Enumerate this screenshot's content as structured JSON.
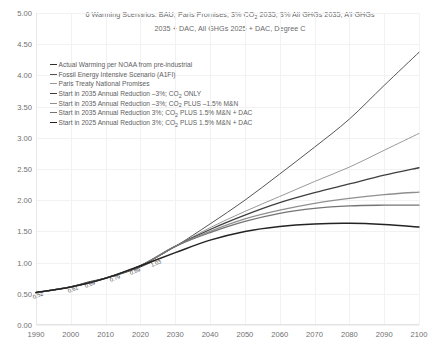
{
  "chart_data": {
    "type": "line",
    "title_line1": "6 Warming Scenarios: BAU, Paris Promises, 3% CO2 2035, 3% All GHGs 2035, All GHGs",
    "title_line2": "2035 + DAC, All GHGs 2025 + DAC, Degree C",
    "xlabel": "",
    "ylabel": "",
    "xlim": [
      1990,
      2100
    ],
    "ylim": [
      0.0,
      5.0
    ],
    "grid": true,
    "legend_position": "upper-left-inside",
    "x_ticks": [
      "1990",
      "2000",
      "2010",
      "2020",
      "2030",
      "2040",
      "2050",
      "2060",
      "2070",
      "2080",
      "2090",
      "2100"
    ],
    "y_ticks": [
      "0.00",
      "0.50",
      "1.00",
      "1.50",
      "2.00",
      "2.50",
      "3.00",
      "3.50",
      "4.00",
      "4.50",
      "5.00"
    ],
    "point_labels": [
      {
        "x": 1990,
        "y": 0.52,
        "text": "0.52"
      },
      {
        "x": 2000,
        "y": 0.61,
        "text": "0.61"
      },
      {
        "x": 2005,
        "y": 0.69,
        "text": "0.69"
      },
      {
        "x": 2012,
        "y": 0.79,
        "text": "0.79"
      },
      {
        "x": 2018,
        "y": 0.89,
        "text": "0.89"
      },
      {
        "x": 2024,
        "y": 1.03,
        "text": "1.03"
      }
    ],
    "series": [
      {
        "name": "Actual Warming per NOAA from pre-industrial",
        "color": "#2e2e2e",
        "width": 1.0,
        "x": [
          1990,
          1995,
          2000,
          2005,
          2010,
          2015,
          2020,
          2024
        ],
        "values": [
          0.52,
          0.56,
          0.61,
          0.69,
          0.75,
          0.83,
          0.93,
          1.03
        ]
      },
      {
        "name": "Fossil Energy Intensive Scenario (A1FI)",
        "color": "#555555",
        "width": 1.0,
        "x": [
          1990,
          2000,
          2010,
          2020,
          2030,
          2040,
          2050,
          2060,
          2070,
          2080,
          2090,
          2100
        ],
        "values": [
          0.52,
          0.61,
          0.75,
          0.95,
          1.26,
          1.62,
          2.0,
          2.42,
          2.85,
          3.3,
          3.84,
          4.37
        ]
      },
      {
        "name": "Paris Treaty National Promises",
        "color": "#9a9a9a",
        "width": 1.0,
        "x": [
          1990,
          2000,
          2010,
          2020,
          2030,
          2040,
          2050,
          2060,
          2070,
          2080,
          2090,
          2100
        ],
        "values": [
          0.52,
          0.61,
          0.75,
          0.95,
          1.26,
          1.56,
          1.82,
          2.06,
          2.3,
          2.53,
          2.8,
          3.07
        ]
      },
      {
        "name": "Start in 2035 Annual Reduction -3%; CO2 ONLY",
        "color": "#3f3f3f",
        "width": 1.3,
        "x": [
          1990,
          2000,
          2010,
          2020,
          2030,
          2040,
          2050,
          2060,
          2070,
          2080,
          2090,
          2100
        ],
        "values": [
          0.52,
          0.61,
          0.75,
          0.95,
          1.26,
          1.53,
          1.76,
          1.96,
          2.12,
          2.26,
          2.4,
          2.52
        ]
      },
      {
        "name": "Start in 2035 Annual Reduction -3%; CO2 PLUS -1.5% M&N",
        "color": "#8f8f8f",
        "width": 1.3,
        "x": [
          1990,
          2000,
          2010,
          2020,
          2030,
          2040,
          2050,
          2060,
          2070,
          2080,
          2090,
          2100
        ],
        "values": [
          0.52,
          0.61,
          0.75,
          0.95,
          1.26,
          1.5,
          1.7,
          1.84,
          1.95,
          2.03,
          2.09,
          2.13
        ]
      },
      {
        "name": "Start in 2035 Annual Reduction 3%; CO2 PLUS 1.5% M&N + DAC",
        "color": "#747474",
        "width": 1.3,
        "x": [
          1990,
          2000,
          2010,
          2020,
          2030,
          2040,
          2050,
          2060,
          2070,
          2080,
          2090,
          2100
        ],
        "values": [
          0.52,
          0.61,
          0.75,
          0.95,
          1.26,
          1.48,
          1.66,
          1.79,
          1.87,
          1.91,
          1.92,
          1.92
        ]
      },
      {
        "name": "Start in 2025 Annual Reduction 3%; CO2 PLUS 1.5% M&N + DAC",
        "color": "#232323",
        "width": 1.5,
        "x": [
          1990,
          2000,
          2010,
          2020,
          2030,
          2040,
          2050,
          2060,
          2070,
          2080,
          2090,
          2100
        ],
        "values": [
          0.52,
          0.61,
          0.75,
          0.95,
          1.16,
          1.36,
          1.5,
          1.58,
          1.62,
          1.63,
          1.61,
          1.57
        ]
      }
    ]
  },
  "legend": {
    "items": [
      {
        "label_pre": "Actual Warming per NOAA from pre-industrial",
        "label_post": "",
        "sub": "",
        "color": "#2e2e2e",
        "width": "1px"
      },
      {
        "label_pre": "Fossil Energy Intensive Scenario (A1FI)",
        "label_post": "",
        "sub": "",
        "color": "#555555",
        "width": "1px"
      },
      {
        "label_pre": "Paris Treaty National Promises",
        "label_post": "",
        "sub": "",
        "color": "#9a9a9a",
        "width": "1px"
      },
      {
        "label_pre": "Start in 2035 Annual Reduction –3%; CO",
        "sub": "2",
        "label_post": " ONLY",
        "color": "#3f3f3f",
        "width": "1.5px"
      },
      {
        "label_pre": "Start in 2035 Annual Reduction –3%; CO",
        "sub": "2",
        "label_post": " PLUS –1.5% M&N",
        "color": "#8f8f8f",
        "width": "1.5px"
      },
      {
        "label_pre": "Start in 2035 Annual Reduction 3%; CO",
        "sub": "2",
        "label_post": " PLUS 1.5% M&N + DAC",
        "color": "#747474",
        "width": "1.5px"
      },
      {
        "label_pre": "Start in 2025 Annual Reduction 3%; CO",
        "sub": "2",
        "label_post": " PLUS 1.5% M&N + DAC",
        "color": "#232323",
        "width": "1.8px"
      }
    ]
  },
  "title": {
    "pre1": "6 Warming Scenarios: BAU, Paris Promises, 3% CO",
    "sub1": "2",
    "post1": " 2035, 3% All GHGs 2035, All GHGs",
    "line2": "2035 + DAC, All GHGs 2025 + DAC, Degree C"
  },
  "colors": {
    "grid": "#f2f2f2",
    "axis": "#e3e3e3",
    "text": "#6f6f6f",
    "background": "#ffffff"
  }
}
